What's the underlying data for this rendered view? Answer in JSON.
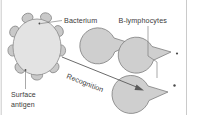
{
  "figure": {
    "background_color": "#ffffff",
    "frame_color": "#bdbdbd",
    "width": 197,
    "height": 115
  },
  "labels": {
    "bacterium": "Bacterium",
    "surface_antigen_line1": "Surface",
    "surface_antigen_line2": "antigen",
    "b_lymphocytes": "B-lymphocytes",
    "recognition": "Recognition"
  },
  "colors": {
    "cell_fill": "#e3e3e3",
    "cell_stroke": "#8a8a8a",
    "antigen_fill": "#c9c9c9",
    "antigen_stroke": "#7e7e7e",
    "lymphocyte_fill": "#cfcfcf",
    "lymphocyte_stroke": "#7e7e7e",
    "text": "#3a3a3a",
    "arrow": "#5a5a5a",
    "leader": "#6e6e6e"
  },
  "bacterium": {
    "center_x": 37,
    "center_y": 47,
    "radius_x": 24,
    "radius_y": 28,
    "antigen_count": 9,
    "antigen_radius_x": 5.6,
    "antigen_radius_y": 4.6
  },
  "lymphocytes": [
    {
      "id": "lymphocyte-1",
      "center_x": 133,
      "center_y": 44,
      "radius": 18,
      "mouth_angle_deg": 186,
      "mouth_spread_deg": 46
    },
    {
      "id": "lymphocyte-2",
      "center_x": 171,
      "center_y": 52,
      "radius": 18,
      "mouth_angle_deg": 190,
      "mouth_spread_deg": 46
    },
    {
      "id": "lymphocyte-3",
      "center_x": 168,
      "center_y": 92,
      "radius": 19,
      "mouth_angle_deg": 188,
      "mouth_spread_deg": 46
    }
  ],
  "arrow": {
    "label": "Recognition",
    "start_x": 62,
    "start_y": 57,
    "end_x": 143,
    "end_y": 90,
    "rotation_deg": 22
  }
}
